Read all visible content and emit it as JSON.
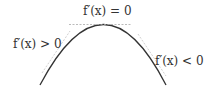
{
  "diagram": {
    "labels": {
      "top": "f′(x) = 0",
      "left": "f′(x) > 0",
      "right": "f′(x) < 0"
    },
    "colors": {
      "curve": "#333333",
      "tangent": "#aaaaaa",
      "text": "#333333"
    }
  }
}
